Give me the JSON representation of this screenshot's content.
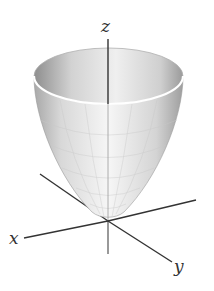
{
  "figure": {
    "surface": "paraboloid",
    "colors": {
      "background": "#ffffff",
      "axis": "#333333",
      "surface_light": "#f4f4f4",
      "surface_mid": "#d9d9d9",
      "surface_dark": "#9a9a9a",
      "rim": "#ffffff",
      "grid": "#c8c8c8"
    },
    "axes": {
      "x": {
        "label": "x"
      },
      "y": {
        "label": "y"
      },
      "z": {
        "label": "z"
      }
    }
  }
}
